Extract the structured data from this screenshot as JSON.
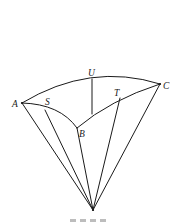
{
  "figure": {
    "labels": {
      "A": "A",
      "S": "S",
      "U": "U",
      "T": "T",
      "C": "C",
      "B": "B"
    },
    "colors": {
      "stroke": "#1a1a1a",
      "background": "#ffffff"
    },
    "caption_visible": false
  }
}
